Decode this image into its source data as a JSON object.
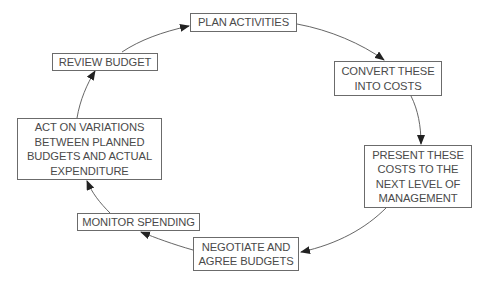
{
  "diagram": {
    "type": "cycle",
    "line_color": "#555555",
    "box_border_color": "#6b6b6b",
    "text_color": "#4a4a4a",
    "steps": [
      {
        "id": "plan",
        "lines": [
          "PLAN ACTIVITIES"
        ]
      },
      {
        "id": "convert",
        "lines": [
          "CONVERT THESE",
          "INTO COSTS"
        ]
      },
      {
        "id": "present",
        "lines": [
          "PRESENT THESE",
          "COSTS TO THE",
          "NEXT LEVEL OF",
          "MANAGEMENT"
        ]
      },
      {
        "id": "negotiate",
        "lines": [
          "NEGOTIATE AND",
          "AGREE BUDGETS"
        ]
      },
      {
        "id": "monitor",
        "lines": [
          "MONITOR SPENDING"
        ]
      },
      {
        "id": "act",
        "lines": [
          "ACT ON VARIATIONS",
          "BETWEEN PLANNED",
          "BUDGETS AND ACTUAL",
          "EXPENDITURE"
        ]
      },
      {
        "id": "review",
        "lines": [
          "REVIEW BUDGET"
        ]
      }
    ],
    "connections": [
      {
        "from": "plan",
        "to": "convert"
      },
      {
        "from": "convert",
        "to": "present"
      },
      {
        "from": "present",
        "to": "negotiate"
      },
      {
        "from": "negotiate",
        "to": "monitor"
      },
      {
        "from": "monitor",
        "to": "act"
      },
      {
        "from": "act",
        "to": "review"
      },
      {
        "from": "review",
        "to": "plan"
      }
    ]
  }
}
